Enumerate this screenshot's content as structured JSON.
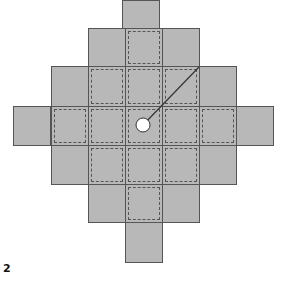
{
  "figure": {
    "label": "2",
    "colors": {
      "tile": "#b8b8b8",
      "border": "#555555",
      "circle": "#ffffff"
    },
    "grid": {
      "cell_size": 37,
      "rows": [
        {
          "y": 0,
          "h": 28,
          "cells": [
            {
              "x": 122,
              "dashed": false
            }
          ]
        },
        {
          "y": 28,
          "h": 38,
          "cells": [
            {
              "x": 88,
              "dashed": false
            },
            {
              "x": 125,
              "dashed": true
            },
            {
              "x": 162,
              "dashed": false
            }
          ]
        },
        {
          "y": 66,
          "h": 40,
          "cells": [
            {
              "x": 51,
              "dashed": false
            },
            {
              "x": 88,
              "dashed": true
            },
            {
              "x": 125,
              "dashed": true
            },
            {
              "x": 162,
              "dashed": true
            },
            {
              "x": 199,
              "dashed": false
            }
          ]
        },
        {
          "y": 106,
          "h": 39,
          "cells": [
            {
              "x": 13,
              "dashed": false
            },
            {
              "x": 51,
              "dashed": true
            },
            {
              "x": 88,
              "dashed": true
            },
            {
              "x": 125,
              "dashed": true
            },
            {
              "x": 162,
              "dashed": true
            },
            {
              "x": 199,
              "dashed": true
            },
            {
              "x": 236,
              "dashed": false
            }
          ]
        },
        {
          "y": 145,
          "h": 39,
          "cells": [
            {
              "x": 51,
              "dashed": false
            },
            {
              "x": 88,
              "dashed": true
            },
            {
              "x": 125,
              "dashed": true
            },
            {
              "x": 162,
              "dashed": true
            },
            {
              "x": 199,
              "dashed": false
            }
          ]
        },
        {
          "y": 184,
          "h": 38,
          "cells": [
            {
              "x": 88,
              "dashed": false
            },
            {
              "x": 125,
              "dashed": true
            },
            {
              "x": 162,
              "dashed": false
            }
          ]
        },
        {
          "y": 222,
          "h": 40,
          "cells": [
            {
              "x": 125,
              "dashed": false
            }
          ]
        }
      ]
    },
    "circle": {
      "cx": 143,
      "cy": 125,
      "r": 7
    },
    "line": {
      "x1": 143,
      "y1": 125,
      "x2": 199,
      "y2": 67
    }
  }
}
